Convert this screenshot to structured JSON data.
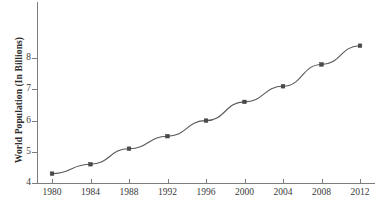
{
  "chart_data": {
    "type": "line",
    "title": "",
    "xlabel": "",
    "ylabel": "World Population (In Billions)",
    "categories": [
      "1980",
      "1984",
      "1988",
      "1992",
      "1996",
      "2000",
      "2004",
      "2008",
      "2012"
    ],
    "x": [
      1980,
      1984,
      1988,
      1992,
      1996,
      2000,
      2004,
      2008,
      2012
    ],
    "values": [
      4.3,
      4.6,
      5.1,
      5.5,
      6.0,
      6.6,
      7.1,
      7.8,
      8.4
    ],
    "series": [
      {
        "name": "World Population",
        "values": [
          4.3,
          4.6,
          5.1,
          5.5,
          6.0,
          6.6,
          7.1,
          7.8,
          8.4
        ]
      }
    ],
    "xlim": [
      1980,
      2012
    ],
    "ylim": [
      4,
      8.6
    ],
    "yticks": [
      4,
      5,
      6,
      7,
      8
    ],
    "ytick_labels": [
      "4",
      "5",
      "6",
      "7",
      "8"
    ],
    "xticks": [
      1980,
      1984,
      1988,
      1992,
      1996,
      2000,
      2004,
      2008,
      2012
    ],
    "grid": false,
    "legend": false,
    "legend_position": "none",
    "marker": "square",
    "line_color": "#595959",
    "marker_color": "#4a4a4a",
    "axis_color": "#7d7d7d"
  }
}
